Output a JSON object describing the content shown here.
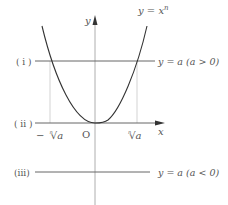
{
  "diagram": {
    "curve_label": "y = x",
    "curve_exponent": "n",
    "axes": {
      "y_label": "y",
      "x_label": "x",
      "origin_label": "O"
    },
    "lines": [
      {
        "id": "i",
        "tag": "( i )",
        "label": "y = a (a > 0)"
      },
      {
        "id": "ii",
        "tag": "( ii )",
        "label": ""
      },
      {
        "id": "iii",
        "tag": "(iii)",
        "label": "y = a (a < 0)"
      }
    ],
    "x_ticks": {
      "neg_root": "−",
      "root_index": "n",
      "root_symbol": "√",
      "root_arg": "a"
    },
    "colors": {
      "curve": "#333333",
      "line": "#666666",
      "axis": "#888888",
      "guide": "#bbbbbb",
      "text": "#555555"
    }
  }
}
